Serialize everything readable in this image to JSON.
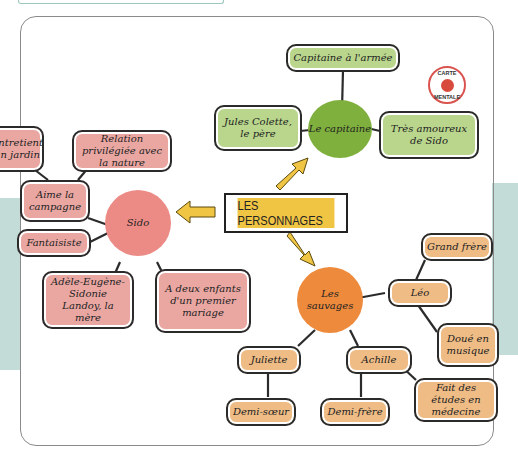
{
  "badge": {
    "line1": "CARTE",
    "line2": "MENTALE",
    "color": "#d84a3c"
  },
  "center": {
    "label": "LES PERSONNAGES",
    "color": "#f1c544"
  },
  "groups": {
    "capitaine": {
      "label": "Le capitaine",
      "color": "#7fb03d",
      "children": [
        "Capitaine à l'armée",
        "Jules Colette, le père",
        "Très amoureux de Sido"
      ]
    },
    "sido": {
      "label": "Sido",
      "color": "#ec8b86",
      "children": [
        "Entretient un jardin",
        "Relation privilégiée avec la nature",
        "Aime la campagne",
        "Fantaisiste",
        "Adèle-Eugène-Sidonie Landoy, la mère",
        "A deux enfants d'un premier mariage"
      ]
    },
    "sauvages": {
      "label": "Les sauvages",
      "color": "#ee8a3c",
      "children": [
        "Léo",
        "Juliette",
        "Achille"
      ],
      "leo": [
        "Grand frère",
        "Doué en musique"
      ],
      "juliette": [
        "Demi-sœur"
      ],
      "achille": [
        "Demi-frère",
        "Fait des études en médecine"
      ]
    }
  }
}
